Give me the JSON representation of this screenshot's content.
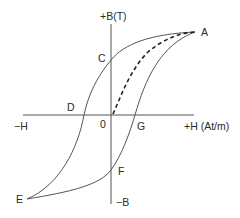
{
  "diagram": {
    "axes": {
      "y_positive_label": "+B(T)",
      "y_negative_label": "−B",
      "x_positive_label": "+H (At/m)",
      "x_negative_label": "−H",
      "origin_label": "0"
    },
    "points": {
      "A": "A",
      "C": "C",
      "D": "D",
      "E": "E",
      "F": "F",
      "G": "G"
    },
    "curves": [
      {
        "name": "initial-magnetization",
        "style": "dashed",
        "from": "0",
        "to": "A"
      },
      {
        "name": "descending-branch",
        "style": "solid",
        "path": [
          "A",
          "C",
          "D",
          "E"
        ]
      },
      {
        "name": "ascending-branch",
        "style": "solid",
        "path": [
          "E",
          "F",
          "G",
          "A"
        ]
      }
    ],
    "colors": {
      "line": "#555555",
      "text": "#2a2a2a",
      "background": "#ffffff"
    }
  }
}
